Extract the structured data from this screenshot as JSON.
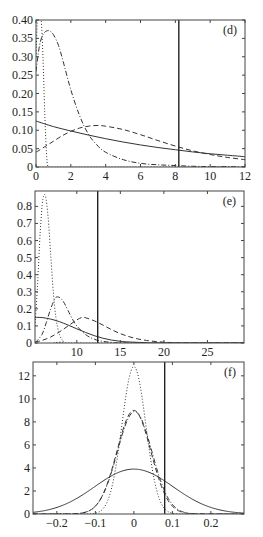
{
  "chart_data": [
    {
      "panel": "d",
      "type": "line",
      "label": "(d)",
      "xlim": [
        0,
        12
      ],
      "ylim": [
        0,
        0.4
      ],
      "xticks": [
        0,
        2,
        4,
        6,
        8,
        10,
        12
      ],
      "xtick_labels": [
        "0",
        "2",
        "4",
        "6",
        "8",
        "10",
        "12"
      ],
      "yticks": [
        0,
        0.05,
        0.1,
        0.15,
        0.2,
        0.25,
        0.3,
        0.35,
        0.4
      ],
      "ytick_labels": [
        "0",
        "0.05",
        "0.10",
        "0.15",
        "0.20",
        "0.25",
        "0.30",
        "0.35",
        "0.40"
      ],
      "vline_x": 8.2,
      "box": {
        "left": 36,
        "top": 20,
        "right": 245,
        "bottom": 167
      },
      "series": [
        {
          "name": "solid",
          "style": "solid",
          "x": [
            0,
            1,
            2,
            3,
            4,
            5,
            6,
            7,
            8,
            9,
            10,
            11,
            12
          ],
          "y": [
            0.125,
            0.11,
            0.098,
            0.087,
            0.077,
            0.068,
            0.06,
            0.053,
            0.047,
            0.041,
            0.036,
            0.032,
            0.028
          ]
        },
        {
          "name": "dashed",
          "style": "dashed",
          "x": [
            0,
            0.5,
            1,
            1.5,
            2,
            2.5,
            3,
            3.5,
            4,
            5,
            6,
            7,
            8,
            9,
            10,
            11,
            12
          ],
          "y": [
            0.04,
            0.055,
            0.07,
            0.085,
            0.097,
            0.106,
            0.111,
            0.113,
            0.111,
            0.102,
            0.088,
            0.072,
            0.057,
            0.044,
            0.034,
            0.026,
            0.02
          ]
        },
        {
          "name": "dash-dot",
          "style": "dashdot",
          "x": [
            0,
            0.2,
            0.4,
            0.6,
            0.8,
            1.0,
            1.3,
            1.6,
            2.0,
            2.5,
            3,
            3.5,
            4,
            5,
            6,
            7,
            8,
            9,
            10,
            11,
            12
          ],
          "y": [
            0.26,
            0.33,
            0.36,
            0.37,
            0.37,
            0.36,
            0.33,
            0.28,
            0.21,
            0.14,
            0.09,
            0.06,
            0.04,
            0.02,
            0.01,
            0.006,
            0.004,
            0.002,
            0.001,
            0.001,
            0.0
          ]
        },
        {
          "name": "dotted",
          "style": "dotted",
          "x": [
            0,
            0.1,
            0.2,
            0.3,
            0.4,
            0.5,
            0.6,
            0.7,
            1.0,
            12
          ],
          "y": [
            0.3,
            0.42,
            0.42,
            0.4,
            0.3,
            0.15,
            0.04,
            0.0,
            0.0,
            0.0
          ]
        }
      ]
    },
    {
      "panel": "e",
      "type": "line",
      "label": "(e)",
      "xlim": [
        5.2,
        29.2
      ],
      "ylim": [
        0,
        0.89
      ],
      "xticks": [
        10,
        15,
        20,
        25
      ],
      "xtick_labels": [
        "10",
        "15",
        "20",
        "25"
      ],
      "yticks": [
        0,
        0.1,
        0.2,
        0.3,
        0.4,
        0.5,
        0.6,
        0.7,
        0.8
      ],
      "ytick_labels": [
        "0",
        "0.1",
        "0.2",
        "0.3",
        "0.4",
        "0.5",
        "0.6",
        "0.7",
        "0.8"
      ],
      "vline_x": 12.4,
      "box": {
        "left": 35,
        "top": 191,
        "right": 244,
        "bottom": 343
      },
      "series": [
        {
          "name": "solid",
          "style": "solid",
          "x": [
            5.2,
            6,
            7,
            8,
            9,
            10,
            11,
            12,
            13,
            14,
            15,
            16,
            18,
            20,
            29.2
          ],
          "y": [
            0.15,
            0.149,
            0.14,
            0.125,
            0.105,
            0.083,
            0.062,
            0.043,
            0.028,
            0.017,
            0.01,
            0.006,
            0.002,
            0.0,
            0.0
          ]
        },
        {
          "name": "dashed",
          "style": "dashed",
          "x": [
            5.2,
            6,
            7,
            8,
            9,
            10,
            10.6,
            11,
            12,
            13,
            14,
            15,
            16,
            17,
            18,
            19,
            20,
            21,
            22,
            29.2
          ],
          "y": [
            0.005,
            0.015,
            0.035,
            0.065,
            0.1,
            0.135,
            0.15,
            0.148,
            0.13,
            0.105,
            0.078,
            0.055,
            0.037,
            0.024,
            0.015,
            0.009,
            0.005,
            0.002,
            0.0,
            0.0
          ]
        },
        {
          "name": "dash-dot",
          "style": "dashdot",
          "x": [
            5.2,
            6,
            6.5,
            7,
            7.5,
            7.8,
            8.2,
            8.6,
            9,
            9.5,
            10,
            11,
            12,
            13,
            14,
            16,
            29.2
          ],
          "y": [
            0.0,
            0.05,
            0.12,
            0.2,
            0.26,
            0.27,
            0.26,
            0.23,
            0.19,
            0.14,
            0.1,
            0.05,
            0.022,
            0.01,
            0.004,
            0.0,
            0.0
          ]
        },
        {
          "name": "dotted",
          "style": "dotted",
          "x": [
            5.2,
            5.5,
            5.8,
            6.1,
            6.4,
            6.7,
            7.0,
            7.3,
            7.6,
            8.0,
            8.5,
            9.0,
            29.2
          ],
          "y": [
            0.1,
            0.35,
            0.65,
            0.84,
            0.86,
            0.74,
            0.52,
            0.3,
            0.15,
            0.05,
            0.01,
            0.0,
            0.0
          ]
        }
      ]
    },
    {
      "panel": "f",
      "type": "line",
      "label": "(f)",
      "xlim": [
        -0.262,
        0.286
      ],
      "ylim": [
        0,
        13.2
      ],
      "xticks": [
        -0.2,
        -0.1,
        0,
        0.1,
        0.2
      ],
      "xtick_labels": [
        "-0.2",
        "-0.1",
        "0",
        "0.1",
        "0.2"
      ],
      "yticks": [
        0,
        2,
        4,
        6,
        8,
        10,
        12
      ],
      "ytick_labels": [
        "0",
        "2",
        "4",
        "6",
        "8",
        "10",
        "12"
      ],
      "vline_x": 0.08,
      "box": {
        "left": 33,
        "top": 362,
        "right": 244,
        "bottom": 514
      },
      "series": [
        {
          "name": "solid",
          "style": "solid",
          "gaussian": {
            "peak": 3.9,
            "mu": 0.0,
            "sigma": 0.102
          }
        },
        {
          "name": "dashed",
          "style": "dashed",
          "gaussian": {
            "peak": 9.0,
            "mu": 0.0,
            "sigma": 0.044
          }
        },
        {
          "name": "dash-dot",
          "style": "dashdot",
          "gaussian": {
            "peak": 8.9,
            "mu": 0.002,
            "sigma": 0.045
          }
        },
        {
          "name": "dotted",
          "style": "dotted",
          "gaussian": {
            "peak": 12.8,
            "mu": 0.0,
            "sigma": 0.031
          }
        }
      ]
    }
  ]
}
